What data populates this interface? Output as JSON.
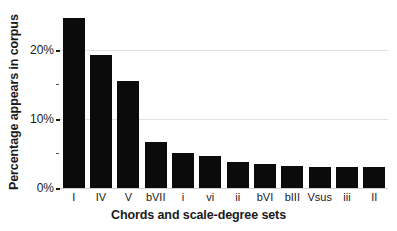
{
  "chart_data": {
    "type": "bar",
    "title": "",
    "xlabel": "Chords and scale-degree sets",
    "ylabel": "Percentage appears in corpus",
    "categories": [
      "I",
      "IV",
      "V",
      "bVII",
      "i",
      "vi",
      "ii",
      "bVI",
      "bIII",
      "Vsus",
      "iii",
      "II"
    ],
    "values": [
      24.6,
      19.2,
      15.4,
      6.6,
      5.1,
      4.6,
      3.8,
      3.5,
      3.2,
      3.1,
      3.0,
      3.0
    ],
    "ylim": [
      0,
      26
    ],
    "yticks": [
      0,
      10,
      20
    ],
    "ytick_labels": [
      "0%",
      "10%",
      "20%"
    ],
    "grid": true,
    "legend": "none",
    "bar_color": "#0b0b0b",
    "grid_color": "#e2e2e2",
    "background": "#ffffff"
  }
}
